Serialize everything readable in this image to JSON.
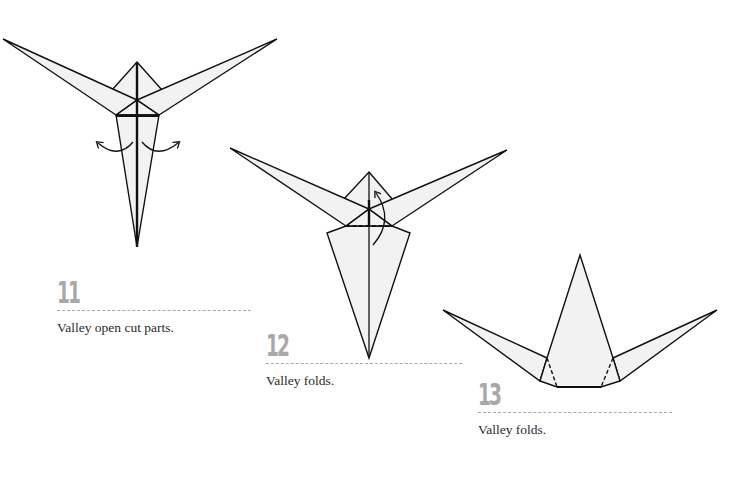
{
  "page": {
    "type": "origami-instruction-page",
    "colors": {
      "background": "#ffffff",
      "paper_fill": "#f2f2f2",
      "line": "#111111",
      "step_number": "#a8a8a8",
      "rule": "#a9a9a9",
      "caption": "#2a2a2a"
    }
  },
  "steps": [
    {
      "number": "11",
      "caption": "Valley open cut parts.",
      "arrows": [
        "curved-arrow-left",
        "curved-arrow-right"
      ]
    },
    {
      "number": "12",
      "caption": "Valley folds.",
      "arrows": [
        "curved-arrow-up"
      ],
      "fold_line": "dashed-valley-fold"
    },
    {
      "number": "13",
      "caption": "Valley folds.",
      "fold_line": "dashed-valley-folds"
    }
  ]
}
